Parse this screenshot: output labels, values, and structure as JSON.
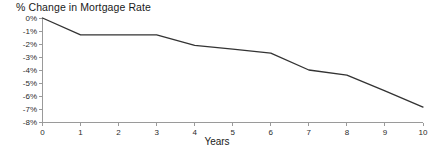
{
  "chart_data": {
    "type": "line",
    "title": "% Change in Mortgage Rate",
    "xlabel": "Years",
    "ylabel": "",
    "x": [
      0,
      1,
      2,
      3,
      4,
      5,
      6,
      7,
      8,
      9,
      10
    ],
    "values": [
      0,
      -1.3,
      -1.3,
      -1.3,
      -2.1,
      -2.4,
      -2.7,
      -4.0,
      -4.4,
      -5.6,
      -6.85
    ],
    "series": [
      {
        "name": "% Change in Mortgage Rate",
        "values": [
          0,
          -1.3,
          -1.3,
          -1.3,
          -2.1,
          -2.4,
          -2.7,
          -4.0,
          -4.4,
          -5.6,
          -6.85
        ]
      }
    ],
    "xlim": [
      0,
      10
    ],
    "ylim": [
      -8,
      0
    ],
    "xticks": [
      0,
      1,
      2,
      3,
      4,
      5,
      6,
      7,
      8,
      9,
      10
    ],
    "xtick_labels": [
      "0",
      "1",
      "2",
      "3",
      "4",
      "5",
      "6",
      "7",
      "8",
      "9",
      "10"
    ],
    "yticks": [
      0,
      -1,
      -2,
      -3,
      -4,
      -5,
      -6,
      -7,
      -8
    ],
    "ytick_labels": [
      "0%",
      "-1%",
      "-2%",
      "-3%",
      "-4%",
      "-5%",
      "-6%",
      "-7%",
      "-8%"
    ],
    "grid": false,
    "legend": false,
    "legend_position": "none",
    "colors": {
      "line": "#333333",
      "axis": "#9a9a9a",
      "text": "#1a1a1a",
      "background": "#ffffff"
    }
  }
}
